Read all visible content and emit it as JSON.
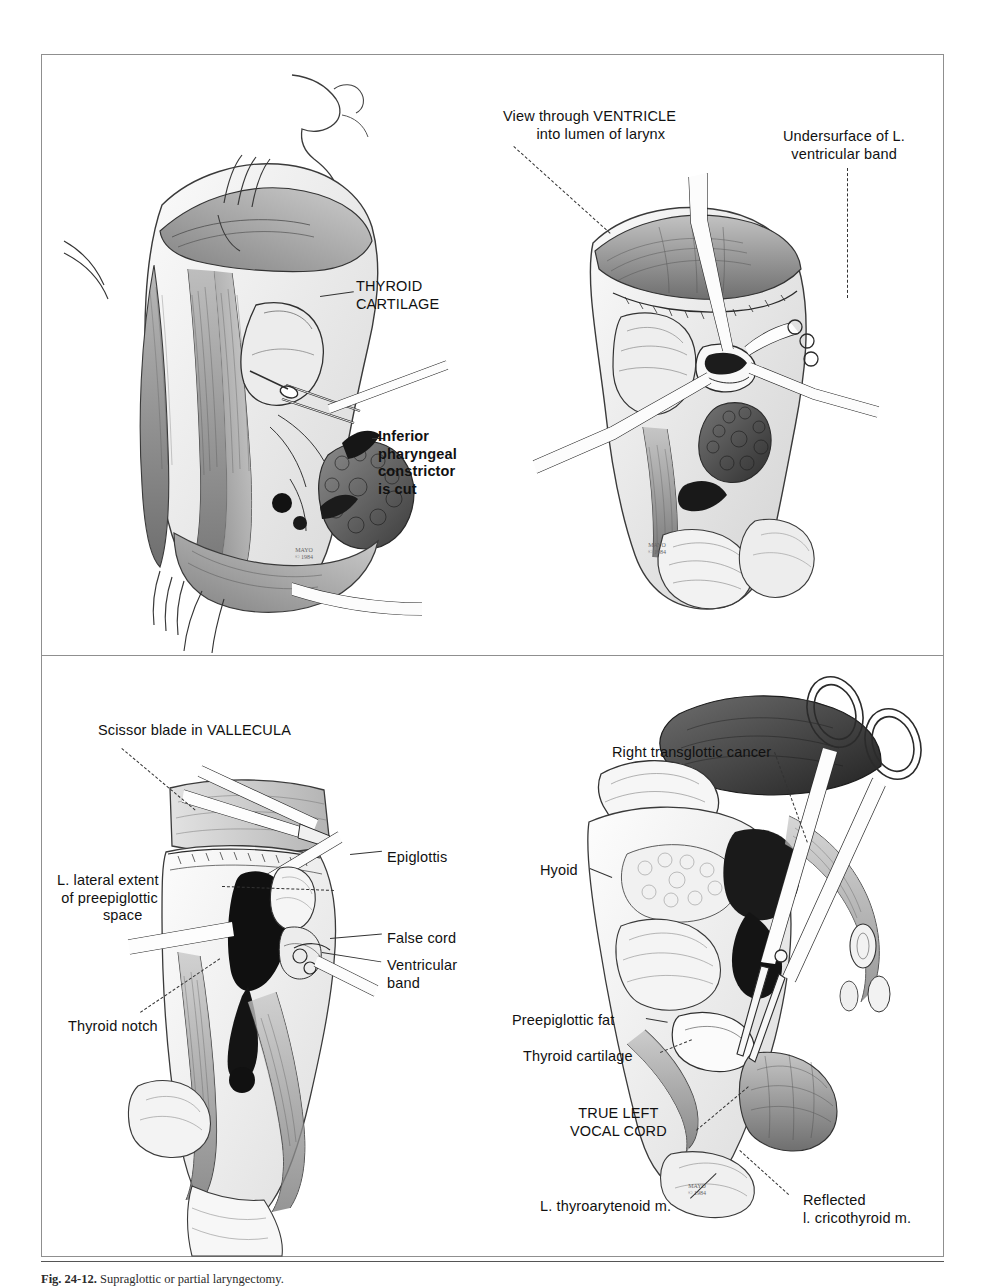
{
  "figure": {
    "caption_number": "Fig. 24-12.",
    "caption_text": " Supraglottic or partial laryngectomy.",
    "frame_color": "#8f8f8f",
    "ink_color": "#111111",
    "background": "#ffffff"
  },
  "panels": {
    "top_left": {
      "name": "Exposure of thyroid cartilage",
      "labels": [
        {
          "id": "thyroid-cartilage",
          "text": "THYROID\nCARTILAGE",
          "bold": false,
          "x": 356,
          "y": 278
        },
        {
          "id": "inferior-pharyngeal-constrictor",
          "text": "Inferior\npharyngeal\nconstrictor\nis cut",
          "bold": true,
          "x": 378,
          "y": 428
        }
      ],
      "signature": "MAYO\n© 1984"
    },
    "top_right": {
      "name": "View through ventricle into lumen of larynx",
      "labels": [
        {
          "id": "view-through-ventricle",
          "text": "View through VENTRICLE\n        into lumen of larynx",
          "bold": false,
          "x": 503,
          "y": 108
        },
        {
          "id": "undersurface-l-ventricular-band",
          "text": "Undersurface of L.\n  ventricular band",
          "bold": false,
          "x": 783,
          "y": 128
        }
      ],
      "signature": "MAYO\n© 1984"
    },
    "bottom_left": {
      "name": "Scissor transection at vallecula",
      "labels": [
        {
          "id": "scissor-blade-in-vallecula",
          "text": "Scissor blade in VALLECULA",
          "bold": false,
          "x": 98,
          "y": 722
        },
        {
          "id": "l-lateral-extent-preepiglottic-space",
          "text": "L. lateral extent\n of preepiglottic\n           space",
          "bold": false,
          "x": 57,
          "y": 872
        },
        {
          "id": "thyroid-notch",
          "text": "Thyroid notch",
          "bold": false,
          "x": 68,
          "y": 1018
        },
        {
          "id": "epiglottis",
          "text": "Epiglottis",
          "bold": false,
          "x": 387,
          "y": 849
        },
        {
          "id": "false-cord",
          "text": "False cord",
          "bold": false,
          "x": 387,
          "y": 930
        },
        {
          "id": "ventricular-band",
          "text": "Ventricular\nband",
          "bold": false,
          "x": 387,
          "y": 957
        }
      ]
    },
    "bottom_right": {
      "name": "Right transglottic cancer specimen",
      "labels": [
        {
          "id": "right-transglottic-cancer",
          "text": "Right transglottic cancer",
          "bold": false,
          "x": 612,
          "y": 744
        },
        {
          "id": "hyoid",
          "text": "Hyoid",
          "bold": false,
          "x": 540,
          "y": 862
        },
        {
          "id": "preepiglottic-fat",
          "text": "Preepiglottic fat",
          "bold": false,
          "x": 512,
          "y": 1012
        },
        {
          "id": "thyroid-cartilage-br",
          "text": "Thyroid cartilage",
          "bold": false,
          "x": 523,
          "y": 1048
        },
        {
          "id": "true-left-vocal-cord",
          "text": "TRUE LEFT\nVOCAL CORD",
          "bold": false,
          "x": 570,
          "y": 1105
        },
        {
          "id": "l-thyroarytenoid-m",
          "text": "L. thyroarytenoid m.",
          "bold": false,
          "x": 540,
          "y": 1198
        },
        {
          "id": "reflected-l-cricothyroid-m",
          "text": "Reflected\nl. cricothyroid m.",
          "bold": false,
          "x": 803,
          "y": 1192
        }
      ],
      "signature": "MAYO\n© 1984"
    }
  }
}
